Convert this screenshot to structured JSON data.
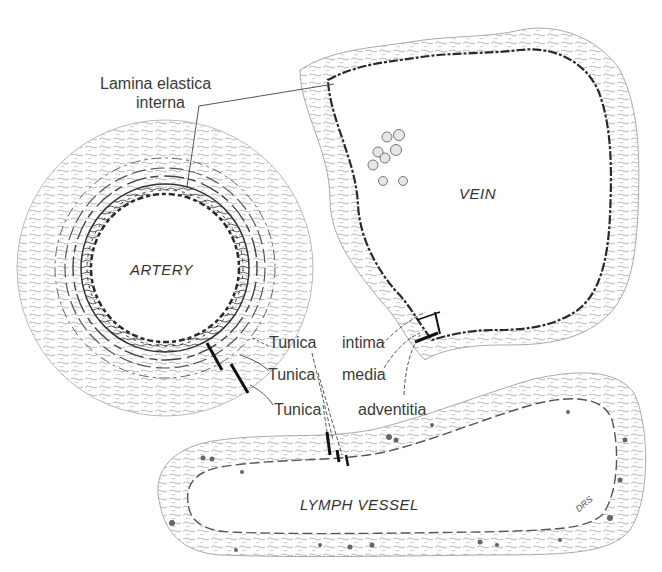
{
  "figure": {
    "vessels": {
      "artery": "ARTERY",
      "vein": "VEIN",
      "lymph": "LYMPH VESSEL"
    },
    "labels": {
      "lamina_line1": "Lamina elastica",
      "lamina_line2": "interna",
      "tunica_1": "Tunica",
      "tunica_2": "Tunica",
      "tunica_3": "Tunica",
      "intima": "intima",
      "media": "media",
      "adventitia": "adventitia"
    },
    "signature": "DRS",
    "colors": {
      "ink": "#2a2a2a",
      "tissue": "#8a8a8a",
      "background": "#ffffff"
    }
  }
}
